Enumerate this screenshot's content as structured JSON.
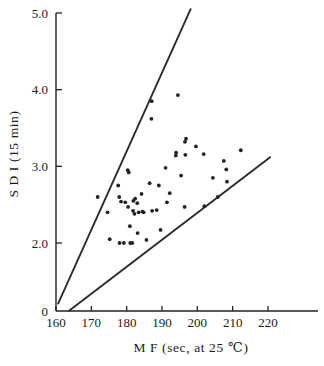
{
  "figure": {
    "name": "sdi-vs-mf-scatter",
    "background_color": "#ffffff",
    "ink_color": "#222222"
  },
  "chart_data": {
    "type": "scatter",
    "title": "",
    "subtitle": "",
    "xlabel": "M F (sec,  at  25 ℃)",
    "ylabel": "S D I  (15 min)",
    "xlim": [
      160,
      220
    ],
    "ylim": [
      0,
      5.0
    ],
    "grid": false,
    "legend": null,
    "x_ticks": [
      160,
      170,
      180,
      190,
      200,
      210,
      220
    ],
    "x_tick_labels": [
      "160",
      "170",
      "180",
      "190",
      "200",
      "210",
      "220"
    ],
    "y_ticks": [
      0,
      2.0,
      3.0,
      4.0,
      5.0
    ],
    "y_tick_labels": [
      "0",
      "2.0",
      "3.0",
      "4.0",
      "5.0"
    ],
    "y_axis_break": true,
    "series": [
      {
        "name": "SDI observations",
        "marker": "dot",
        "color": "#222222",
        "points": [
          [
            171.8,
            2.6
          ],
          [
            174.6,
            2.4
          ],
          [
            175.2,
            2.05
          ],
          [
            177.6,
            2.75
          ],
          [
            177.9,
            2.6
          ],
          [
            178.4,
            2.54
          ],
          [
            178.0,
            2.0
          ],
          [
            179.2,
            2.0
          ],
          [
            179.6,
            2.53
          ],
          [
            180.3,
            2.95
          ],
          [
            180.6,
            2.92
          ],
          [
            180.4,
            2.47
          ],
          [
            180.9,
            2.22
          ],
          [
            181.0,
            2.0
          ],
          [
            181.6,
            2.0
          ],
          [
            181.9,
            2.55
          ],
          [
            181.8,
            2.42
          ],
          [
            182.4,
            2.58
          ],
          [
            182.2,
            2.38
          ],
          [
            183.0,
            2.52
          ],
          [
            183.4,
            2.4
          ],
          [
            183.1,
            2.13
          ],
          [
            184.2,
            2.64
          ],
          [
            184.5,
            2.41
          ],
          [
            184.8,
            2.4
          ],
          [
            185.6,
            2.04
          ],
          [
            186.5,
            2.78
          ],
          [
            187.1,
            3.85
          ],
          [
            187.0,
            3.62
          ],
          [
            187.2,
            2.42
          ],
          [
            188.5,
            2.43
          ],
          [
            189.1,
            2.75
          ],
          [
            189.6,
            2.17
          ],
          [
            191.0,
            2.98
          ],
          [
            191.4,
            2.53
          ],
          [
            192.2,
            2.65
          ],
          [
            193.9,
            3.14
          ],
          [
            194.0,
            3.18
          ],
          [
            194.5,
            3.93
          ],
          [
            195.4,
            2.88
          ],
          [
            196.5,
            3.32
          ],
          [
            196.8,
            3.36
          ],
          [
            196.6,
            3.15
          ],
          [
            196.4,
            2.47
          ],
          [
            199.6,
            3.26
          ],
          [
            201.8,
            3.16
          ],
          [
            202.0,
            2.48
          ],
          [
            204.4,
            2.85
          ],
          [
            205.8,
            2.6
          ],
          [
            207.5,
            3.07
          ],
          [
            208.2,
            2.96
          ],
          [
            208.4,
            2.8
          ],
          [
            212.3,
            3.21
          ]
        ]
      }
    ],
    "reference_lines": [
      {
        "name": "upper-bound-line",
        "x0": 160.6,
        "y0": 0.22,
        "x1": 198.1,
        "y1": 5.05
      },
      {
        "name": "lower-bound-line",
        "x0": 163.7,
        "y0": 0.01,
        "x1": 220.6,
        "y1": 3.12
      }
    ]
  }
}
